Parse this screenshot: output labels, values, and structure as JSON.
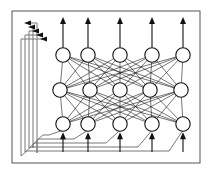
{
  "figure": {
    "type": "diagram",
    "background_color": "#ffffff",
    "ink_color": "#111111",
    "frame_color": "#555555",
    "loop_color": "#777777",
    "canvas": {
      "width": 212,
      "height": 177
    }
  },
  "frame": {
    "label": "network-boundary",
    "x": 12,
    "y": 11,
    "width": 188,
    "height": 152
  },
  "network": {
    "layer_count": 3,
    "nodes_per_layer": 5,
    "node_radius": 7.2,
    "fully_connected": true,
    "layers": [
      {
        "name": "output-layer",
        "index": 0,
        "y": 55,
        "node_x": [
          63,
          88,
          120,
          152,
          183
        ],
        "node_labels": [
          "o1",
          "o2",
          "o3",
          "o4",
          "o5"
        ]
      },
      {
        "name": "hidden-layer",
        "index": 1,
        "y": 90,
        "node_x": [
          60,
          90,
          120,
          150,
          181
        ],
        "node_labels": [
          "h1",
          "h2",
          "h3",
          "h4",
          "h5"
        ]
      },
      {
        "name": "input-layer",
        "index": 2,
        "y": 124,
        "node_x": [
          63,
          88,
          120,
          152,
          183
        ],
        "node_labels": [
          "i1",
          "i2",
          "i3",
          "i4",
          "i5"
        ]
      }
    ]
  },
  "output_arrows": {
    "name": "output-signals",
    "count": 5,
    "direction": "up",
    "tip_y": 17,
    "x": [
      63,
      88,
      120,
      152,
      183
    ]
  },
  "input_arrows": {
    "name": "input-signals",
    "count": 5,
    "direction": "up",
    "base_y": 152,
    "x": [
      63,
      88,
      120,
      152,
      183
    ]
  },
  "feedback_loops": {
    "name": "recurrent-feedback",
    "count": 5,
    "arrowhead_direction": "left",
    "description": "Each input-layer node feeds back around the left edge to the output layer",
    "loops": [
      {
        "index": 0,
        "source_x": 63,
        "left_x": 37,
        "bottom_y": 157,
        "top_y": 23,
        "head_x": 24,
        "branch_y": 135
      },
      {
        "index": 1,
        "source_x": 88,
        "left_x": 33,
        "bottom_y": 152,
        "top_y": 27,
        "head_x": 28,
        "branch_y": 139
      },
      {
        "index": 2,
        "source_x": 120,
        "left_x": 29,
        "bottom_y": 147,
        "top_y": 31,
        "head_x": 32,
        "branch_y": 143
      },
      {
        "index": 3,
        "source_x": 152,
        "left_x": 25,
        "bottom_y": 142,
        "top_y": 35,
        "head_x": 36,
        "branch_y": 147
      },
      {
        "index": 4,
        "source_x": 183,
        "left_x": 21,
        "bottom_y": 137,
        "top_y": 39,
        "head_x": 40,
        "branch_y": 151
      }
    ]
  }
}
